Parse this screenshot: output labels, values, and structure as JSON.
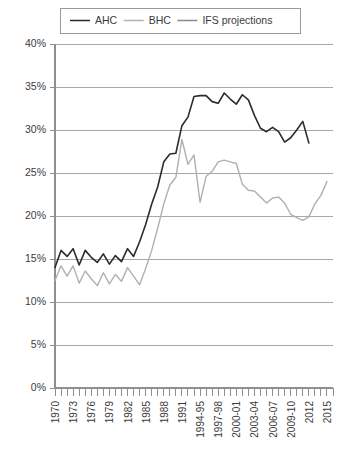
{
  "chart_data": {
    "type": "line",
    "title": "",
    "xlabel": "",
    "ylabel": "",
    "ylim": [
      0,
      40
    ],
    "xlim": [
      1970,
      2016
    ],
    "grid": true,
    "legend_position": "top",
    "y_ticks": [
      "0%",
      "5%",
      "10%",
      "15%",
      "20%",
      "25%",
      "30%",
      "35%",
      "40%"
    ],
    "y_tick_values": [
      0,
      5,
      10,
      15,
      20,
      25,
      30,
      35,
      40
    ],
    "x_tick_labels": [
      "1970",
      "1973",
      "1976",
      "1979",
      "1982",
      "1985",
      "1988",
      "1991",
      "1994-95",
      "1997-98",
      "2000-01",
      "2003-04",
      "2006-07",
      "2009-10",
      "2012",
      "2015"
    ],
    "x_tick_years": [
      1970,
      1973,
      1976,
      1979,
      1982,
      1985,
      1988,
      1991,
      1994,
      1997,
      2000,
      2003,
      2006,
      2009,
      2012,
      2015
    ],
    "x_minor_years": [
      1970,
      1971,
      1972,
      1973,
      1974,
      1975,
      1976,
      1977,
      1978,
      1979,
      1980,
      1981,
      1982,
      1983,
      1984,
      1985,
      1986,
      1987,
      1988,
      1989,
      1990,
      1991,
      1992,
      1993,
      1994,
      1995,
      1996,
      1997,
      1998,
      1999,
      2000,
      2001,
      2002,
      2003,
      2004,
      2005,
      2006,
      2007,
      2008,
      2009,
      2010,
      2011,
      2012,
      2013,
      2014,
      2015,
      2016
    ],
    "series": [
      {
        "name": "AHC",
        "color": "#2b2b2b",
        "width": 1.6,
        "x": [
          1970,
          1971,
          1972,
          1973,
          1974,
          1975,
          1976,
          1977,
          1978,
          1979,
          1980,
          1981,
          1982,
          1983,
          1984,
          1985,
          1986,
          1987,
          1988,
          1989,
          1990,
          1991,
          1992,
          1993,
          1994,
          1995,
          1996,
          1997,
          1998,
          1999,
          2000,
          2001,
          2002,
          2003,
          2004,
          2005,
          2006,
          2007,
          2008,
          2009,
          2010,
          2011,
          2012
        ],
        "values": [
          14.0,
          16.0,
          15.3,
          16.2,
          14.3,
          16.0,
          15.2,
          14.6,
          15.6,
          14.4,
          15.4,
          14.7,
          16.2,
          15.3,
          17.0,
          19.0,
          21.4,
          23.4,
          26.3,
          27.2,
          27.3,
          30.5,
          31.5,
          33.9,
          34.0,
          34.0,
          33.3,
          33.1,
          34.3,
          33.6,
          33.0,
          34.1,
          33.5,
          31.7,
          30.2,
          29.8,
          30.3,
          29.8,
          28.6,
          29.1,
          30.0,
          31.0,
          28.5
        ]
      },
      {
        "name": "BHC",
        "color": "#b0b0b0",
        "width": 1.4,
        "x": [
          1970,
          1971,
          1972,
          1973,
          1974,
          1975,
          1976,
          1977,
          1978,
          1979,
          1980,
          1981,
          1982,
          1983,
          1984,
          1985,
          1986,
          1987,
          1988,
          1989,
          1990,
          1991,
          1992,
          1993,
          1994,
          1995,
          1996,
          1997,
          1998,
          1999,
          2000,
          2001,
          2002,
          2003,
          2004,
          2005,
          2006,
          2007,
          2008,
          2009,
          2010,
          2011,
          2012,
          2013,
          2014,
          2015
        ],
        "values": [
          12.5,
          14.2,
          13.0,
          14.2,
          12.2,
          13.6,
          12.7,
          11.9,
          13.4,
          12.1,
          13.2,
          12.4,
          14.0,
          13.0,
          12.0,
          13.9,
          16.0,
          18.6,
          21.4,
          23.6,
          24.5,
          28.9,
          26.0,
          27.1,
          21.6,
          24.6,
          25.2,
          26.3,
          26.5,
          26.3,
          26.1,
          23.7,
          23.0,
          22.9,
          22.2,
          21.5,
          22.1,
          22.2,
          21.5,
          20.2,
          19.8,
          19.5,
          19.9,
          21.4,
          22.4,
          24.0
        ]
      },
      {
        "name": "IFS projections",
        "color": "#8a8a8a",
        "width": 1.5,
        "x": [],
        "values": []
      }
    ]
  },
  "legend": {
    "items": [
      {
        "label": "AHC",
        "color": "#2b2b2b"
      },
      {
        "label": "BHC",
        "color": "#b0b0b0"
      },
      {
        "label": "IFS projections",
        "color": "#8a8a8a"
      }
    ]
  }
}
